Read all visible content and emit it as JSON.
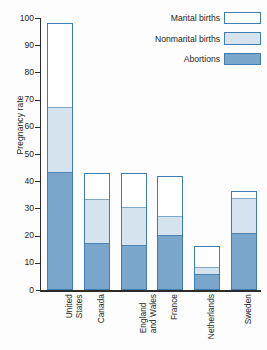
{
  "chart_data": {
    "type": "bar",
    "title": "",
    "xlabel": "",
    "ylabel": "Pregnancy rate",
    "ylim": [
      0,
      100
    ],
    "ytick_step": 10,
    "yticks": [
      0,
      10,
      20,
      30,
      40,
      50,
      60,
      70,
      80,
      90,
      100
    ],
    "grid": false,
    "stacked": true,
    "legend_position": "top-right",
    "categories": [
      "United States",
      "Canada",
      "England and Wales",
      "France",
      "Netherlands",
      "Sweden"
    ],
    "category_lines": [
      [
        "United",
        "States"
      ],
      [
        "Canada",
        ""
      ],
      [
        "England",
        "and Wales"
      ],
      [
        "France",
        ""
      ],
      [
        "Netherlands",
        ""
      ],
      [
        "Sweden",
        ""
      ]
    ],
    "series": [
      {
        "name": "Abortions",
        "values": [
          43,
          17,
          16,
          20,
          5.5,
          20.5
        ]
      },
      {
        "name": "Nonmarital births",
        "values": [
          24,
          16,
          14,
          7,
          2.5,
          13
        ]
      },
      {
        "name": "Marital births",
        "values": [
          31,
          10,
          13,
          15,
          8,
          3
        ]
      }
    ],
    "segment_tops": {
      "abortions": [
        43,
        17,
        16,
        20,
        5.5,
        20.5
      ],
      "nonmarital": [
        67,
        33,
        30,
        27,
        8,
        33.5
      ],
      "total": [
        98,
        43,
        43,
        42,
        16,
        36.5
      ]
    },
    "colors": {
      "marital": "#ffffff",
      "nonmarital": "#d4e3ee",
      "abortions": "#7ba6cb",
      "outline": "#3d7fb5",
      "axis": "#2c2c2c",
      "text": "#231f20"
    }
  },
  "legend": {
    "items": [
      {
        "label": "Marital births",
        "swatch": "marital"
      },
      {
        "label": "Nonmarital births",
        "swatch": "nonmarital"
      },
      {
        "label": "Abortions",
        "swatch": "abortions"
      }
    ]
  },
  "axis": {
    "y_label": "Pregnancy rate",
    "y_tick_labels": [
      "100",
      "90",
      "80",
      "70",
      "60",
      "50",
      "40",
      "30",
      "20",
      "10",
      "0"
    ]
  }
}
